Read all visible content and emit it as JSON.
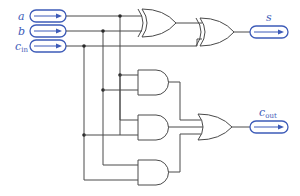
{
  "diagram": {
    "colors": {
      "io": "#3d5bb8",
      "wire": "#4a4a4a"
    },
    "inputs": [
      {
        "name": "a",
        "label": "a",
        "sub": ""
      },
      {
        "name": "b",
        "label": "b",
        "sub": ""
      },
      {
        "name": "cin",
        "label": "c",
        "sub": "in"
      }
    ],
    "outputs": [
      {
        "name": "s",
        "label": "s",
        "sub": ""
      },
      {
        "name": "cout",
        "label": "c",
        "sub": "out"
      }
    ],
    "gates": [
      {
        "id": "xor1",
        "type": "XOR",
        "inputs": [
          "a",
          "b"
        ]
      },
      {
        "id": "xor2",
        "type": "XOR",
        "inputs": [
          "xor1",
          "cin"
        ],
        "output": "s"
      },
      {
        "id": "and1",
        "type": "AND",
        "inputs": [
          "a",
          "b"
        ]
      },
      {
        "id": "and2",
        "type": "AND",
        "inputs": [
          "a",
          "cin"
        ]
      },
      {
        "id": "and3",
        "type": "AND",
        "inputs": [
          "b",
          "cin"
        ]
      },
      {
        "id": "or1",
        "type": "OR",
        "inputs": [
          "and1",
          "and2",
          "and3"
        ],
        "output": "cout"
      }
    ]
  }
}
